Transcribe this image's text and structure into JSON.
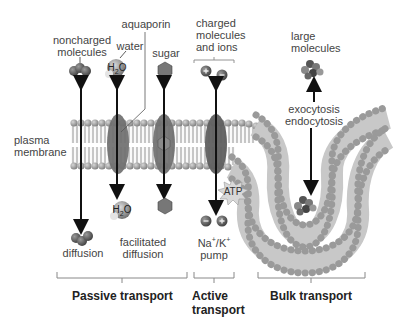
{
  "labels": {
    "noncharged": [
      "noncharged",
      "molecules"
    ],
    "aquaporin": "aquaporin",
    "water": "water",
    "sugar": "sugar",
    "charged": [
      "charged",
      "molecules",
      "and ions"
    ],
    "large": [
      "large",
      "molecules"
    ],
    "exocytosis": "exocytosis",
    "endocytosis": "endocytosis",
    "plasma_membrane": [
      "plasma",
      "membrane"
    ],
    "atp": "ATP",
    "h2o_top": "H2O",
    "h2o_bottom": "H2O",
    "diffusion": "diffusion",
    "facilitated": [
      "facilitated",
      "diffusion"
    ],
    "pump": [
      "Na+/K+",
      "pump"
    ]
  },
  "categories": {
    "passive": "Passive transport",
    "active": [
      "Active",
      "transport"
    ],
    "bulk": "Bulk transport"
  },
  "colors": {
    "head": "#9a9a9a",
    "tail": "#c8c8c8",
    "protein": "#6f6f6f",
    "molecule": "#666666",
    "arrow": "#111111",
    "bracket": "#8a8a8a"
  }
}
